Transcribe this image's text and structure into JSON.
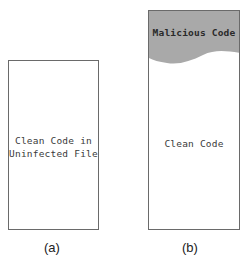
{
  "panels": [
    {
      "caption": "(a)",
      "regions": [
        {
          "label_line1": "Clean Code in",
          "label_line2": "Uninfected File",
          "fill": "#ffffff"
        }
      ]
    },
    {
      "caption": "(b)",
      "regions": [
        {
          "label": "Malicious Code",
          "fill": "#a9a9a9"
        },
        {
          "label": "Clean Code",
          "fill": "#ffffff"
        }
      ]
    }
  ],
  "colors": {
    "border": "#6a6a6a",
    "malicious_fill": "#a9a9a9"
  }
}
